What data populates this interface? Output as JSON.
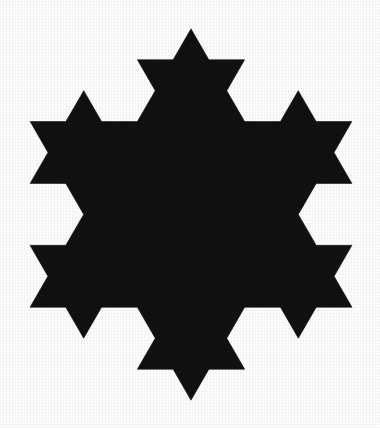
{
  "figure": {
    "name": "koch-snowflake",
    "title": "Koch Snowflake",
    "caption": "",
    "type": "fractal",
    "iterations": 2,
    "seed_shape": "equilateral-triangle",
    "orientation": "apex-up",
    "fill_color": "#111111",
    "stroke_color": "#111111",
    "background_color": "#fdfdfd",
    "canvas": {
      "width": 380,
      "height": 428
    },
    "bounding_box": {
      "left": 30,
      "top": 24,
      "right": 352,
      "bottom": 405
    },
    "center": {
      "x": 191,
      "y": 218
    },
    "base_triangle": {
      "side_length": 322,
      "vertices": [
        {
          "x": 191,
          "y": 24
        },
        {
          "x": 352,
          "y": 302.4
        },
        {
          "x": 30,
          "y": 302.4
        }
      ]
    },
    "spike_count_outer": 12,
    "apex_points": {
      "top": {
        "x": 191,
        "y": 24
      },
      "bottom": {
        "x": 191,
        "y": 405
      },
      "left": {
        "x": 30,
        "y": 148
      },
      "right": {
        "x": 352,
        "y": 148
      }
    }
  }
}
